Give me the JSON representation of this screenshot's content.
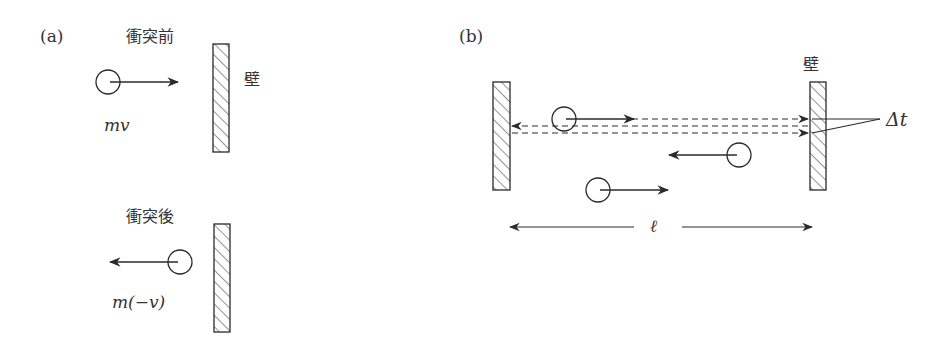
{
  "panel_a": {
    "label": "(a)",
    "before_title": "衝突前",
    "after_title": "衝突後",
    "wall_label": "壁",
    "momentum_before": "mv",
    "momentum_after": "m(−v)"
  },
  "panel_b": {
    "label": "(b)",
    "wall_label": "壁",
    "delta_t_label": "Δt",
    "length_label": "ℓ"
  },
  "colors": {
    "stroke": "#2a2a2a",
    "background": "#ffffff"
  }
}
